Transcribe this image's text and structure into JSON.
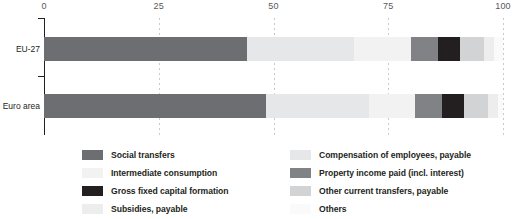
{
  "chart_data": {
    "type": "bar",
    "orientation": "horizontal",
    "stacked": true,
    "title": "",
    "subtitle": "",
    "xlabel": "",
    "ylabel": "",
    "xlim": [
      0,
      100
    ],
    "xticks": [
      0,
      25,
      50,
      75,
      100
    ],
    "xtick_labels": [
      "0",
      "25",
      "50",
      "75",
      "100"
    ],
    "grid": true,
    "grid_axis": "x",
    "grid_style": "dotted",
    "legend_position": "bottom",
    "legend_columns": 2,
    "categories": [
      "EU-27",
      "Euro area"
    ],
    "series": [
      {
        "name": "Social transfers",
        "color": "#6d6e71",
        "values": [
          44.2,
          48.4
        ]
      },
      {
        "name": "Compensation of employees, payable",
        "color": "#e6e7e8",
        "values": [
          23.4,
          22.5
        ]
      },
      {
        "name": "Intermediate consumption",
        "color": "#f2f2f2",
        "values": [
          12.4,
          10.0
        ]
      },
      {
        "name": "Property income paid (incl. interest)",
        "color": "#808285",
        "values": [
          5.9,
          5.8
        ]
      },
      {
        "name": "Gross fixed capital formation",
        "color": "#231f20",
        "values": [
          4.8,
          4.8
        ]
      },
      {
        "name": "Other current transfers, payable",
        "color": "#d1d3d4",
        "values": [
          5.2,
          5.2
        ]
      },
      {
        "name": "Subsidies, payable",
        "color": "#ededed",
        "values": [
          2.1,
          2.3
        ]
      },
      {
        "name": "Others",
        "color": "#fafafa",
        "values": [
          2.0,
          1.0
        ]
      }
    ]
  },
  "axis": {
    "ticks": [
      {
        "label": "0",
        "value": 0
      },
      {
        "label": "25",
        "value": 25
      },
      {
        "label": "50",
        "value": 50
      },
      {
        "label": "75",
        "value": 75
      },
      {
        "label": "100",
        "value": 100
      }
    ]
  },
  "bars": [
    {
      "category": "EU-27",
      "segments": [
        {
          "series": "Social transfers",
          "color": "#6d6e71",
          "start": 0,
          "size": 44.2
        },
        {
          "series": "Compensation of employees, payable",
          "color": "#e6e7e8",
          "start": 44.2,
          "size": 23.4
        },
        {
          "series": "Intermediate consumption",
          "color": "#f2f2f2",
          "start": 67.6,
          "size": 12.4
        },
        {
          "series": "Property income paid (incl. interest)",
          "color": "#808285",
          "start": 80.0,
          "size": 5.9
        },
        {
          "series": "Gross fixed capital formation",
          "color": "#231f20",
          "start": 85.9,
          "size": 4.8
        },
        {
          "series": "Other current transfers, payable",
          "color": "#d1d3d4",
          "start": 90.7,
          "size": 5.2
        },
        {
          "series": "Subsidies, payable",
          "color": "#ededed",
          "start": 95.9,
          "size": 2.1
        },
        {
          "series": "Others",
          "color": "#fafafa",
          "start": 98.0,
          "size": 2.0
        }
      ]
    },
    {
      "category": "Euro area",
      "segments": [
        {
          "series": "Social transfers",
          "color": "#6d6e71",
          "start": 0,
          "size": 48.4
        },
        {
          "series": "Compensation of employees, payable",
          "color": "#e6e7e8",
          "start": 48.4,
          "size": 22.5
        },
        {
          "series": "Intermediate consumption",
          "color": "#f2f2f2",
          "start": 70.9,
          "size": 10.0
        },
        {
          "series": "Property income paid (incl. interest)",
          "color": "#808285",
          "start": 80.9,
          "size": 5.8
        },
        {
          "series": "Gross fixed capital formation",
          "color": "#231f20",
          "start": 86.7,
          "size": 4.8
        },
        {
          "series": "Other current transfers, payable",
          "color": "#d1d3d4",
          "start": 91.5,
          "size": 5.2
        },
        {
          "series": "Subsidies, payable",
          "color": "#ededed",
          "start": 96.7,
          "size": 2.3
        },
        {
          "series": "Others",
          "color": "#fafafa",
          "start": 99.0,
          "size": 1.0
        }
      ]
    }
  ],
  "legend": {
    "left_column": [
      {
        "label": "Social transfers",
        "color": "#6d6e71"
      },
      {
        "label": "Intermediate consumption",
        "color": "#f2f2f2"
      },
      {
        "label": "Gross fixed capital formation",
        "color": "#231f20"
      },
      {
        "label": "Subsidies, payable",
        "color": "#ededed"
      }
    ],
    "right_column": [
      {
        "label": "Compensation of employees, payable",
        "color": "#e6e7e8"
      },
      {
        "label": "Property income paid (incl. interest)",
        "color": "#808285"
      },
      {
        "label": "Other current transfers, payable",
        "color": "#d1d3d4"
      },
      {
        "label": "Others",
        "color": "#fafafa"
      }
    ]
  }
}
